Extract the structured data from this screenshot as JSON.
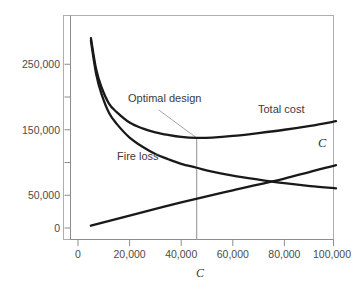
{
  "chart_data": {
    "type": "line",
    "title": "",
    "subtitle": "",
    "xlabel": "C",
    "ylabel": "",
    "xlim": [
      0,
      100000
    ],
    "ylim": [
      0,
      290000
    ],
    "grid": false,
    "legend_position": "inline-annotations",
    "xticks": [
      0,
      20000,
      40000,
      60000,
      80000,
      100000
    ],
    "xticklabels": [
      "0",
      "20,000",
      "40,000",
      "60,000",
      "80,000",
      "100,000"
    ],
    "yticks": [
      0,
      50000,
      150000,
      250000
    ],
    "yticklabels": [
      "0",
      "50,000",
      "150,000",
      "250,000"
    ],
    "yticks_minor": [
      100000,
      200000
    ],
    "series": [
      {
        "name": "Total cost",
        "label": "Total cost",
        "x": [
          5000,
          7000,
          9000,
          12000,
          15000,
          20000,
          25000,
          30000,
          35000,
          40000,
          46000,
          52000,
          60000,
          70000,
          80000,
          90000,
          100000
        ],
        "values": [
          290000,
          243000,
          216000,
          190000,
          177000,
          161000,
          152000,
          146000,
          142000,
          139000,
          137500,
          138000,
          140500,
          145000,
          150000,
          156000,
          163000
        ]
      },
      {
        "name": "Fire loss",
        "label": "Fire loss",
        "x": [
          5000,
          7000,
          9000,
          12000,
          15000,
          20000,
          25000,
          30000,
          35000,
          40000,
          46000,
          52000,
          60000,
          70000,
          80000,
          90000,
          100000
        ],
        "values": [
          286000,
          236000,
          206000,
          176000,
          159000,
          138000,
          124000,
          113000,
          105000,
          98000,
          92000,
          86000,
          80000,
          74000,
          68500,
          64000,
          60500
        ]
      },
      {
        "name": "C",
        "label": "C",
        "x": [
          5000,
          20000,
          40000,
          60000,
          80000,
          100000
        ],
        "values": [
          3500,
          19000,
          39000,
          57500,
          75500,
          96000
        ]
      }
    ],
    "annotations": [
      {
        "text": "Optimal design",
        "points_to_x": 46000,
        "points_to_y": 137500,
        "marker": "vertical-line-at-optimum"
      }
    ]
  },
  "axis": {
    "x_title": "C",
    "y_title": ""
  }
}
